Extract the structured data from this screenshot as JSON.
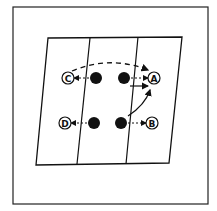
{
  "diagram": {
    "labels": {
      "a": "A",
      "b": "B",
      "c": "C",
      "d": "D"
    },
    "colors": {
      "ink": "#111111",
      "background": "#ffffff"
    }
  }
}
